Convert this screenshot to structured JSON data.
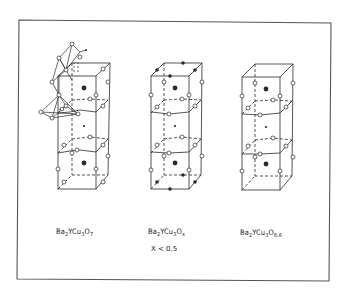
{
  "figure": {
    "structures": [
      {
        "id": "left",
        "formula_base": "Ba",
        "formula_parts": [
          {
            "t": "Ba",
            "sub": "2"
          },
          {
            "t": "YCu",
            "sub": "3"
          },
          {
            "t": "O",
            "sub": "7"
          }
        ],
        "formula_text": "Ba2YCu3O7",
        "note": "shown with linked Cu–O polyhedra at upper left"
      },
      {
        "id": "middle",
        "formula_parts": [
          {
            "t": "Ba",
            "sub": "2"
          },
          {
            "t": "YCu",
            "sub": "3"
          },
          {
            "t": "O",
            "sub": "x"
          }
        ],
        "formula_text": "Ba2YCu3Ox",
        "condition": "X < 0.5"
      },
      {
        "id": "right",
        "formula_parts": [
          {
            "t": "Ba",
            "sub": "2"
          },
          {
            "t": "YCu",
            "sub": "3"
          },
          {
            "t": "O",
            "sub": "6.6"
          }
        ],
        "formula_text": "Ba2YCu3O6.6"
      }
    ],
    "legend_symbols": {
      "open_circle": "oxygen site",
      "large_filled_circle": "Ba",
      "small_filled_circle": "Y",
      "dark_filled_circle": "occupied/partial site"
    },
    "colors": {
      "line": "#2a2a2a",
      "frame": "#555555",
      "background": "#ffffff"
    }
  }
}
